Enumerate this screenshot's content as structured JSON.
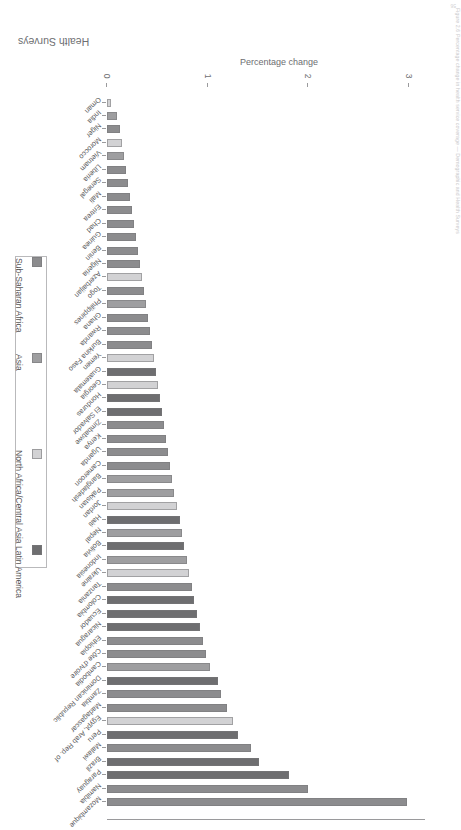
{
  "figure": {
    "running_caption": "Figure 2.6  Percentage change in health service coverage — Demographic and Health Surveys",
    "caption_text": "Health Surveys",
    "figure_number": "56"
  },
  "legend": {
    "position": "middle-right",
    "items": [
      {
        "label": "Sub-Saharan Africa",
        "color": "#8c8c8e"
      },
      {
        "label": "Asia",
        "color": "#9e9ea0"
      },
      {
        "label": "North Africa/Central Asia",
        "color": "#d2d2d4"
      },
      {
        "label": "Latin America",
        "color": "#6e6e70"
      }
    ]
  },
  "chart_data": {
    "type": "bar",
    "orientation": "horizontal",
    "title": "",
    "xlabel": "",
    "ylabel": "Percentage change",
    "ylim": [
      0,
      3.15
    ],
    "yticks": [
      0,
      1,
      2,
      3
    ],
    "ytick_labels": [
      "0",
      "1",
      "2",
      "3"
    ],
    "grid": false,
    "region_colors": {
      "Sub-Saharan Africa": "#8c8c8e",
      "Asia": "#9e9ea0",
      "North Africa/Central Asia": "#d2d2d4",
      "Latin America": "#6e6e70"
    },
    "categories": [
      "Mozambique",
      "Namibia",
      "Paraguay",
      "Brazil",
      "Malawi",
      "Peru",
      "Egypt, Arab Rep. of",
      "Madagascar",
      "Zambia",
      "Dominican Republic",
      "Cambodia",
      "Côte d'Ivoire",
      "Ethiopia",
      "Nicaragua",
      "Ecuador",
      "Colombia",
      "Tanzania",
      "Ukraine",
      "Indonesia",
      "Bolivia",
      "Nepal",
      "Haiti",
      "Jordan",
      "Pakistan",
      "Bangladesh",
      "Cameroon",
      "Uganda",
      "Kenya",
      "Zimbabwe",
      "El Salvador",
      "Honduras",
      "Georgia",
      "Guatemala",
      "Yemen",
      "Burkina Faso",
      "Rwanda",
      "Ghana",
      "Philippines",
      "Togo",
      "Azerbaijan",
      "Nigeria",
      "Benin",
      "Guinea",
      "Chad",
      "Eritrea",
      "Mali",
      "Senegal",
      "Liberia",
      "Vietnam",
      "Morocco",
      "Niger",
      "India",
      "Oman"
    ],
    "values": [
      2.98,
      2.0,
      1.81,
      1.51,
      1.43,
      1.3,
      1.25,
      1.19,
      1.13,
      1.1,
      1.02,
      0.98,
      0.95,
      0.92,
      0.89,
      0.86,
      0.84,
      0.81,
      0.79,
      0.76,
      0.74,
      0.72,
      0.7,
      0.67,
      0.65,
      0.63,
      0.61,
      0.59,
      0.57,
      0.55,
      0.53,
      0.51,
      0.49,
      0.47,
      0.45,
      0.43,
      0.41,
      0.39,
      0.37,
      0.35,
      0.33,
      0.31,
      0.29,
      0.27,
      0.25,
      0.23,
      0.21,
      0.19,
      0.17,
      0.15,
      0.13,
      0.1,
      0.04
    ],
    "regions": [
      "Sub-Saharan Africa",
      "Sub-Saharan Africa",
      "Latin America",
      "Latin America",
      "Sub-Saharan Africa",
      "Latin America",
      "North Africa/Central Asia",
      "Sub-Saharan Africa",
      "Sub-Saharan Africa",
      "Latin America",
      "Asia",
      "Sub-Saharan Africa",
      "Sub-Saharan Africa",
      "Latin America",
      "Latin America",
      "Latin America",
      "Sub-Saharan Africa",
      "North Africa/Central Asia",
      "Asia",
      "Latin America",
      "Asia",
      "Latin America",
      "North Africa/Central Asia",
      "Asia",
      "Asia",
      "Sub-Saharan Africa",
      "Sub-Saharan Africa",
      "Sub-Saharan Africa",
      "Sub-Saharan Africa",
      "Latin America",
      "Latin America",
      "North Africa/Central Asia",
      "Latin America",
      "North Africa/Central Asia",
      "Sub-Saharan Africa",
      "Sub-Saharan Africa",
      "Sub-Saharan Africa",
      "Asia",
      "Sub-Saharan Africa",
      "North Africa/Central Asia",
      "Sub-Saharan Africa",
      "Sub-Saharan Africa",
      "Sub-Saharan Africa",
      "Sub-Saharan Africa",
      "Sub-Saharan Africa",
      "Sub-Saharan Africa",
      "Sub-Saharan Africa",
      "Sub-Saharan Africa",
      "Asia",
      "North Africa/Central Asia",
      "Sub-Saharan Africa",
      "Asia",
      "North Africa/Central Asia"
    ]
  }
}
